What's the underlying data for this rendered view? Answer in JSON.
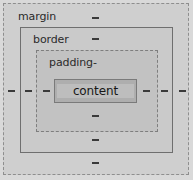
{
  "diagram": {
    "boxes": [
      {
        "key": "margin",
        "label": "margin",
        "border_style": "dashed",
        "border_color": "#8e8e8e",
        "fill": "#cfcfcf"
      },
      {
        "key": "border",
        "label": "border",
        "border_style": "solid",
        "border_color": "#6f6f6f",
        "fill": "#cacaca"
      },
      {
        "key": "padding",
        "label": "padding-",
        "border_style": "dashed",
        "border_color": "#7e7e7e",
        "fill": "#c2c2c2"
      },
      {
        "key": "content",
        "label": "content",
        "border_style": "solid",
        "border_color": "#7a7a7a",
        "fill": "#aeaeae"
      }
    ],
    "dash_markers": {
      "glyph": "-",
      "color": "#3a3a3a",
      "left": [
        {
          "x": 8,
          "y": 90
        },
        {
          "x": 25,
          "y": 90
        },
        {
          "x": 43,
          "y": 90
        }
      ],
      "right": [
        {
          "x": 143,
          "y": 90
        },
        {
          "x": 161,
          "y": 90
        },
        {
          "x": 179,
          "y": 90
        }
      ],
      "top": [
        {
          "x": 92,
          "y": 17
        },
        {
          "x": 92,
          "y": 38
        }
      ],
      "bottom": [
        {
          "x": 92,
          "y": 115
        },
        {
          "x": 92,
          "y": 139
        },
        {
          "x": 92,
          "y": 162
        }
      ]
    },
    "canvas": {
      "background": "#d9d9d9",
      "width": 193,
      "height": 180
    }
  }
}
